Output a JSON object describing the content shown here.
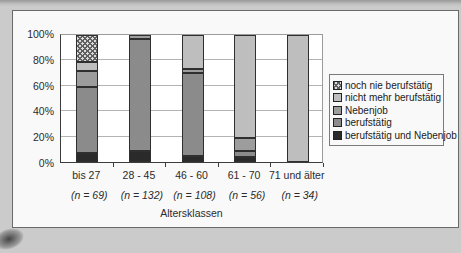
{
  "scan": {
    "page_bg": "#cbcbcb",
    "panel_bg": "#f9f9f9",
    "panel_border": "#6a6a6a"
  },
  "chart_data": {
    "type": "bar",
    "variant": "stacked-100-percent-column",
    "title": "",
    "xlabel": "Altersklassen",
    "ylabel": "",
    "ylim": [
      0,
      100
    ],
    "y_ticks": [
      "0%",
      "20%",
      "40%",
      "60%",
      "80%",
      "100%"
    ],
    "grid": "horizontal, every 20%",
    "categories": [
      "bis 27",
      "28 - 45",
      "46 - 60",
      "61 - 70",
      "71 und älter"
    ],
    "n_labels": [
      "(n = 69)",
      "(n = 132)",
      "(n = 108)",
      "(n = 56)",
      "(n = 34)"
    ],
    "series_bottom_to_top": [
      {
        "name": "berufstätig und Nebenjob",
        "color": "#2a2a2a",
        "values": [
          7,
          9,
          5,
          4,
          0
        ]
      },
      {
        "name": "berufstätig",
        "color": "#8b8b8b",
        "values": [
          52,
          88,
          65,
          5,
          0
        ]
      },
      {
        "name": "Nebenjob",
        "color": "#9d9d9d",
        "values": [
          13,
          3,
          3,
          10,
          0
        ]
      },
      {
        "name": "nicht mehr berufstätig",
        "color": "#bebebe",
        "values": [
          7,
          0,
          27,
          81,
          100
        ]
      },
      {
        "name": "noch nie berufstätig",
        "color": "#dcdcdc",
        "pattern": "crosshatch",
        "pattern_line_color": "#606060",
        "values": [
          21,
          0,
          0,
          0,
          0
        ]
      }
    ],
    "legend": {
      "position": "middle-right",
      "entries_top_to_bottom": [
        "noch nie berufstätig",
        "nicht mehr berufstätig",
        "Nebenjob",
        "berufstätig",
        "berufstätig und Nebenjob"
      ]
    }
  }
}
